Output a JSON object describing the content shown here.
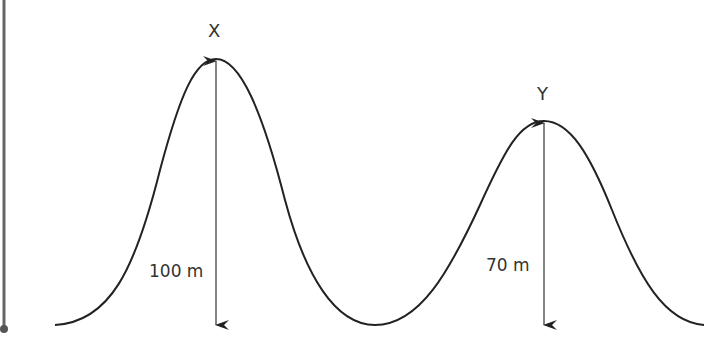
{
  "diagram": {
    "type": "wave-profile",
    "peaks": [
      {
        "id": "X",
        "label": "X",
        "height_label": "100 m",
        "height_value": 100,
        "unit": "m"
      },
      {
        "id": "Y",
        "label": "Y",
        "height_label": "70 m",
        "height_value": 70,
        "unit": "m"
      }
    ],
    "colors": {
      "curve": "#222222",
      "arrow": "#333333",
      "side_bar": "#666666",
      "text": "#333333"
    }
  }
}
